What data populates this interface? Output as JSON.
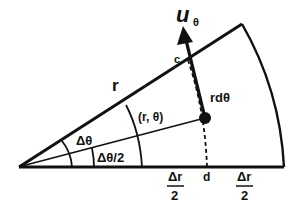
{
  "diagram": {
    "labels": {
      "u_theta_main": "u",
      "u_theta_sub": "θ",
      "r": "r",
      "c": "c",
      "rdtheta": "rdθ",
      "point": "(r, θ)",
      "dtheta": "Δθ",
      "dtheta_half": "Δθ/2",
      "d": "d",
      "dr_num_left": "Δr",
      "dr_den_left": "2",
      "dr_num_right": "Δr",
      "dr_den_right": "2"
    },
    "colors": {
      "ink": "#111111",
      "background": "#ffffff"
    }
  }
}
